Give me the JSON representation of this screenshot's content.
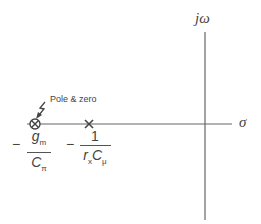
{
  "axes": {
    "vertical_label": "jω",
    "horizontal_label": "σ",
    "color": "#666666"
  },
  "annotation": {
    "text": "Pole & zero"
  },
  "markers": [
    {
      "type": "pole-zero-coincident",
      "symbol": "⊗",
      "x": 35,
      "y": 124
    },
    {
      "type": "pole",
      "symbol": "×",
      "x": 89,
      "y": 124
    }
  ],
  "labels": {
    "first": {
      "sign": "−",
      "numerator": "g",
      "numerator_sub": "m",
      "denominator": "C",
      "denominator_sub": "π"
    },
    "second": {
      "sign": "−",
      "numerator": "1",
      "denominator_a": "r",
      "denominator_a_sub": "x",
      "denominator_b": "C",
      "denominator_b_sub": "μ"
    }
  }
}
